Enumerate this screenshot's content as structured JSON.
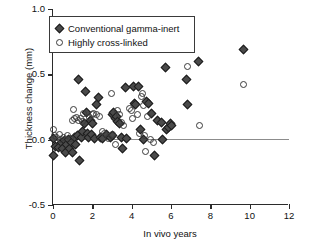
{
  "chart_data": {
    "type": "scatter",
    "title": "",
    "xlabel": "In vivo years",
    "ylabel": "Thickness change (mm)",
    "xlim": [
      0,
      12
    ],
    "ylim": [
      -0.5,
      1.0
    ],
    "xticks": [
      "0",
      "2",
      "4",
      "6",
      "8",
      "10",
      "12"
    ],
    "xtick_values": [
      0,
      2,
      4,
      6,
      8,
      10,
      12
    ],
    "yticks": [
      "-0.5",
      "0.0",
      "0.5",
      "1.0"
    ],
    "ytick_values": [
      -0.5,
      0.0,
      0.5,
      1.0
    ],
    "grid": false,
    "reference_lines": [
      {
        "axis": "y",
        "value": 0.0,
        "color": "#8c8c8c"
      }
    ],
    "legend": {
      "position": "top-left",
      "entries": [
        {
          "label": "Conventional gamma-inert",
          "marker": "filled-diamond",
          "color": "#4a4a4a"
        },
        {
          "label": "Highly cross-linked",
          "marker": "open-circle",
          "color": "#3a3a3a"
        }
      ]
    },
    "series": [
      {
        "name": "Conventional gamma-inert",
        "marker": "filled-diamond",
        "color": "#4a4a4a",
        "points": [
          [
            0.05,
            0.01
          ],
          [
            0.05,
            -0.12
          ],
          [
            0.15,
            -0.05
          ],
          [
            0.3,
            -0.06
          ],
          [
            0.45,
            -0.02
          ],
          [
            0.5,
            -0.07
          ],
          [
            0.6,
            -0.01
          ],
          [
            0.65,
            -0.1
          ],
          [
            0.7,
            -0.04
          ],
          [
            0.8,
            0.0
          ],
          [
            0.85,
            -0.07
          ],
          [
            0.95,
            -0.02
          ],
          [
            1.0,
            -0.1
          ],
          [
            1.1,
            0.02
          ],
          [
            1.15,
            -0.04
          ],
          [
            1.25,
            0.03
          ],
          [
            1.3,
            0.46
          ],
          [
            1.35,
            -0.16
          ],
          [
            1.45,
            0.02
          ],
          [
            1.5,
            0.06
          ],
          [
            1.6,
            0.12
          ],
          [
            1.65,
            0.37
          ],
          [
            1.7,
            0.21
          ],
          [
            1.75,
            0.05
          ],
          [
            1.8,
            0.02
          ],
          [
            1.9,
            0.15
          ],
          [
            1.95,
            0.04
          ],
          [
            2.0,
            0.12
          ],
          [
            2.1,
            0.01
          ],
          [
            2.2,
            0.27
          ],
          [
            2.3,
            0.32
          ],
          [
            2.4,
            0.02
          ],
          [
            2.5,
            0.01
          ],
          [
            2.7,
            0.04
          ],
          [
            2.9,
            0.02
          ],
          [
            3.0,
            0.03
          ],
          [
            3.05,
            0.19
          ],
          [
            3.1,
            0.21
          ],
          [
            3.2,
            0.16
          ],
          [
            3.25,
            0.18
          ],
          [
            3.3,
            0.14
          ],
          [
            3.4,
            0.12
          ],
          [
            3.5,
            0.02
          ],
          [
            3.55,
            -0.07
          ],
          [
            3.7,
            0.4
          ],
          [
            3.75,
            0.01
          ],
          [
            4.1,
            0.41
          ],
          [
            4.15,
            0.28
          ],
          [
            4.2,
            0.27
          ],
          [
            4.35,
            0.41
          ],
          [
            4.45,
            0.08
          ],
          [
            4.6,
            0.0
          ],
          [
            4.75,
            0.29
          ],
          [
            4.85,
            0.28
          ],
          [
            5.0,
            0.2
          ],
          [
            5.15,
            -0.12
          ],
          [
            5.3,
            0.15
          ],
          [
            5.5,
            0.13
          ],
          [
            5.55,
            0.0
          ],
          [
            5.7,
            0.55
          ],
          [
            5.75,
            0.08
          ],
          [
            5.85,
            0.09
          ],
          [
            5.95,
            0.12
          ],
          [
            6.0,
            0.11
          ],
          [
            6.8,
            0.46
          ],
          [
            6.85,
            0.27
          ],
          [
            7.4,
            0.6
          ],
          [
            9.7,
            0.69
          ]
        ]
      },
      {
        "name": "Highly cross-linked",
        "marker": "open-circle",
        "color": "#3a3a3a",
        "points": [
          [
            0.05,
            0.08
          ],
          [
            0.1,
            0.03
          ],
          [
            0.2,
            0.02
          ],
          [
            0.35,
            0.04
          ],
          [
            0.4,
            0.0
          ],
          [
            0.55,
            0.02
          ],
          [
            0.75,
            0.03
          ],
          [
            0.9,
            0.01
          ],
          [
            1.0,
            0.15
          ],
          [
            1.05,
            0.23
          ],
          [
            1.1,
            0.16
          ],
          [
            1.2,
            0.17
          ],
          [
            1.3,
            0.15
          ],
          [
            1.4,
            0.16
          ],
          [
            1.5,
            0.14
          ],
          [
            1.55,
            0.2
          ],
          [
            1.85,
            0.17
          ],
          [
            2.0,
            0.19
          ],
          [
            2.05,
            0.2
          ],
          [
            2.2,
            0.19
          ],
          [
            2.35,
            0.18
          ],
          [
            2.5,
            0.06
          ],
          [
            2.6,
            0.05
          ],
          [
            2.8,
            0.01
          ],
          [
            2.95,
            0.35
          ],
          [
            3.05,
            0.04
          ],
          [
            3.2,
            -0.04
          ],
          [
            3.3,
            0.22
          ],
          [
            3.4,
            0.19
          ],
          [
            3.5,
            0.13
          ],
          [
            3.6,
            0.11
          ],
          [
            3.9,
            0.24
          ],
          [
            4.0,
            0.22
          ],
          [
            4.05,
            0.16
          ],
          [
            4.3,
            0.19
          ],
          [
            4.4,
            0.05
          ],
          [
            4.5,
            0.33
          ],
          [
            4.55,
            0.35
          ],
          [
            4.6,
            0.26
          ],
          [
            4.65,
            0.03
          ],
          [
            4.7,
            -0.09
          ],
          [
            4.8,
            0.18
          ],
          [
            4.95,
            0.0
          ],
          [
            5.1,
            -0.02
          ],
          [
            6.85,
            0.56
          ],
          [
            7.45,
            0.11
          ],
          [
            9.7,
            0.42
          ]
        ]
      }
    ]
  }
}
